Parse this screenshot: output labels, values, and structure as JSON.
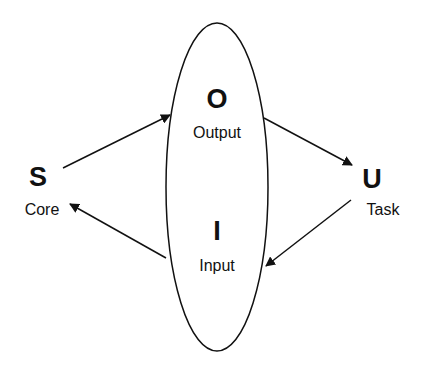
{
  "diagram": {
    "center": {
      "top_letter": "O",
      "top_label": "Output",
      "bottom_letter": "I",
      "bottom_label": "Input"
    },
    "left_node": {
      "letter": "S",
      "label": "Core"
    },
    "right_node": {
      "letter": "U",
      "label": "Task"
    },
    "edges": [
      {
        "from": "S",
        "to": "O"
      },
      {
        "from": "O",
        "to": "U"
      },
      {
        "from": "U",
        "to": "I"
      },
      {
        "from": "I",
        "to": "S"
      }
    ],
    "colors": {
      "stroke": "#111111",
      "background": "#ffffff"
    }
  }
}
